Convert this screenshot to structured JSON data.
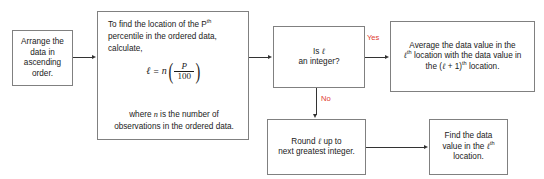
{
  "diagram": {
    "colors": {
      "box_border": "#808080",
      "connector": "#333333",
      "edge_label": "#e03b2e",
      "background": "#ffffff",
      "text": "#1a1a1a"
    },
    "nodes": {
      "arrange": {
        "id": "arrange-data",
        "text": "Arrange the data in ascending order."
      },
      "formula": {
        "id": "compute-location",
        "lead_line_1": "To find the location of the P",
        "lead_line_1_sup": "th",
        "lead_line_2": "percentile in the ordered data,",
        "lead_line_3": "calculate,",
        "equation": {
          "lhs": "ℓ",
          "eqsign": "=",
          "coefficient": "n",
          "numerator": "P",
          "denominator": "100",
          "plain": "ℓ = n(P/100)"
        },
        "tail_line_1_pre": "where ",
        "tail_line_1_var": "n",
        "tail_line_1_post": " is the number of",
        "tail_line_2": "observations in the ordered data."
      },
      "decision": {
        "id": "is-l-integer",
        "line_1_pre": "Is ",
        "line_1_var": "ℓ",
        "line_2": "an integer?"
      },
      "average": {
        "id": "average-two-values",
        "line_1": "Average the data value in the",
        "line_2_var": "ℓ",
        "line_2_sup": "th",
        "line_2_post": " location with the data value in",
        "line_3_pre": "the (",
        "line_3_var": "ℓ",
        "line_3_mid": " + 1)",
        "line_3_sup": "th",
        "line_3_post": " location."
      },
      "round": {
        "id": "round-up",
        "line_1_pre": "Round ",
        "line_1_var": "ℓ",
        "line_1_post": " up to",
        "line_2": "next greatest integer."
      },
      "find": {
        "id": "find-value",
        "line_1": "Find the data",
        "line_2_pre": "value in the ",
        "line_2_var": "ℓ",
        "line_2_sup": "th",
        "line_3": "location."
      }
    },
    "edges": {
      "yes_label": "Yes",
      "no_label": "No"
    }
  }
}
